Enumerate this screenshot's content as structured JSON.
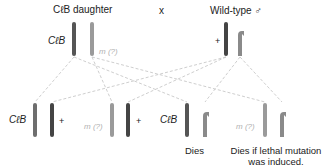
{
  "parents": {
    "female": {
      "title": "CℓB daughter",
      "chromosome_label": "CℓB",
      "mutant_label": "m (?)"
    },
    "cross_symbol": "x",
    "male": {
      "title": "Wild-type ♂",
      "chromosome_label": "+"
    }
  },
  "offspring": [
    {
      "label": "CℓB",
      "partner_label": "+"
    },
    {
      "label": "m (?)",
      "partner_label": "+"
    },
    {
      "label": "CℓB",
      "outcome": "Dies"
    },
    {
      "label": "m (?)",
      "outcome_line1": "Dies if lethal mutation",
      "outcome_line2": "was induced."
    }
  ],
  "colors": {
    "dark_chromosome": "#555555",
    "mid_chromosome": "#6e6e6e",
    "light_chromosome": "#9a9a9a",
    "dashed_line": "#c4c4c4",
    "muted_text": "#b0b0b0"
  }
}
